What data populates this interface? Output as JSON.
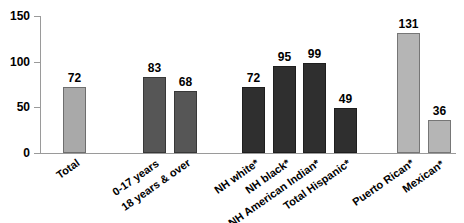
{
  "chart_data": {
    "type": "bar",
    "title": "",
    "subtitle": "",
    "xlabel": "",
    "ylabel": "",
    "ylim": [
      0,
      150
    ],
    "yticks": [
      0,
      50,
      100,
      150
    ],
    "grid": false,
    "legend": "none",
    "categories": [
      "Total",
      "0-17 years",
      "18 years & over",
      "NH white*",
      "NH black*",
      "NH American Indian*",
      "Total Hispanic*",
      "Puerto Rican*",
      "Mexican*",
      "Male*",
      "Female*"
    ],
    "values": [
      72,
      83,
      68,
      72,
      95,
      99,
      49,
      131,
      36,
      62,
      81
    ],
    "bar_colors": [
      "#a9a9a9",
      "#565656",
      "#565656",
      "#2f2f2f",
      "#2f2f2f",
      "#2f2f2f",
      "#2f2f2f",
      "#b5b5b5",
      "#b5b5b5",
      "#b5b5b5",
      "#b5b5b5"
    ],
    "bar_x": [
      63,
      143,
      174,
      242,
      273,
      303,
      334,
      397,
      428,
      505,
      536
    ],
    "bar_width": 23,
    "group_gap": "bars are grouped: Total | age | race-ethnicity | Hispanic-origin | sex"
  }
}
